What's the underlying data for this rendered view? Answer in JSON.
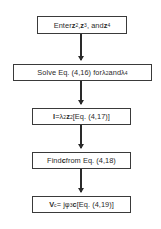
{
  "diagram": {
    "type": "flowchart",
    "steps": [
      {
        "id": 1,
        "text": "Enter z2, z3, and z4",
        "parts": {
          "pre": "Enter ",
          "v1": "z",
          "s1": "2",
          "m1": ", ",
          "v2": "z",
          "s2": "3",
          "m2": ", and ",
          "v3": "z",
          "s3": "4"
        }
      },
      {
        "id": 2,
        "text": "Solve Eq. (4.16) for λ2 and λ4",
        "parts": {
          "pre": "Solve Eq. (4,16) for ",
          "v1": "λ",
          "s1": "2",
          "m1": " and ",
          "v2": "λ",
          "s2": "4"
        }
      },
      {
        "id": 3,
        "text": "I = λ2 z2 [Eq. (4.17)]",
        "parts": {
          "v0": "I",
          "m0": " = ",
          "v1": "λ",
          "s1": "2",
          "v2": "z",
          "s2": "2",
          "post": " [Eq. (4,17)]"
        }
      },
      {
        "id": 4,
        "text": "Find c from Eq. (4.18)",
        "parts": {
          "pre": "Find ",
          "v1": "c",
          "post": " from Eq. (4,18)"
        }
      },
      {
        "id": 5,
        "text": "Vc = jφ3 c [Eq. (4.19)]",
        "parts": {
          "v0": "V",
          "s0": "c",
          "m0": " = j",
          "v1": "φ",
          "s1": "3",
          "v2": "c",
          "post": " [Eq. (4,19)]"
        }
      }
    ],
    "edges": [
      [
        1,
        2
      ],
      [
        2,
        3
      ],
      [
        3,
        4
      ],
      [
        4,
        5
      ]
    ]
  }
}
